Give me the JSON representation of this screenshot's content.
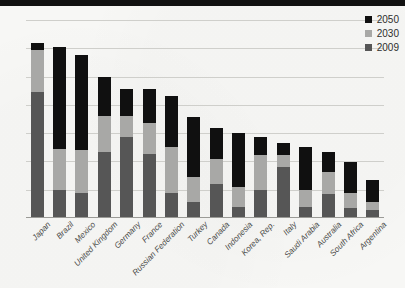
{
  "legend": {
    "position": "top-right",
    "entries": [
      {
        "label": "2050",
        "color": "#101010"
      },
      {
        "label": "2030",
        "color": "#a8a8a6"
      },
      {
        "label": "2009",
        "color": "#565656"
      }
    ]
  },
  "axis": {
    "yticks": [
      "0",
      "1",
      "2",
      "3",
      "4",
      "5",
      "6",
      "7"
    ]
  },
  "chart_data": {
    "type": "bar",
    "stacked": true,
    "title": "",
    "subtitle": "",
    "xlabel": "",
    "ylabel": "",
    "ylim": [
      0,
      7
    ],
    "ytick_values": [
      0,
      1,
      2,
      3,
      4,
      5,
      6,
      7
    ],
    "grid": true,
    "legend_position": "top-right",
    "categories": [
      "Japan",
      "Brazil",
      "Mexico",
      "United Kingdom",
      "Germany",
      "France",
      "Russian Federation",
      "Turkey",
      "Canada",
      "Indonesia",
      "Korea, Rep.",
      "Italy",
      "Saudi Arabia",
      "Australia",
      "South Africa",
      "Argentina"
    ],
    "series": [
      {
        "name": "2009",
        "color": "#565656",
        "values": [
          4.45,
          1.0,
          0.9,
          2.35,
          2.85,
          2.25,
          0.9,
          0.55,
          1.22,
          0.4,
          1.0,
          1.8,
          0.4,
          0.85,
          0.35,
          0.3
        ]
      },
      {
        "name": "2030",
        "color": "#a8a8a6",
        "values": [
          1.5,
          1.45,
          1.5,
          1.25,
          0.75,
          1.1,
          1.6,
          0.9,
          0.88,
          0.7,
          1.22,
          0.42,
          0.6,
          0.78,
          0.52,
          0.25
        ]
      },
      {
        "name": "2050",
        "color": "#101010",
        "values": [
          0.25,
          3.6,
          3.35,
          1.4,
          0.95,
          1.2,
          1.8,
          2.12,
          1.1,
          1.92,
          0.64,
          0.42,
          1.5,
          0.7,
          1.12,
          0.8
        ]
      }
    ],
    "totals": [
      6.2,
      6.05,
      5.75,
      5.0,
      4.55,
      4.55,
      4.3,
      3.57,
      3.2,
      3.02,
      2.86,
      2.64,
      2.5,
      2.33,
      1.99,
      1.35
    ]
  }
}
